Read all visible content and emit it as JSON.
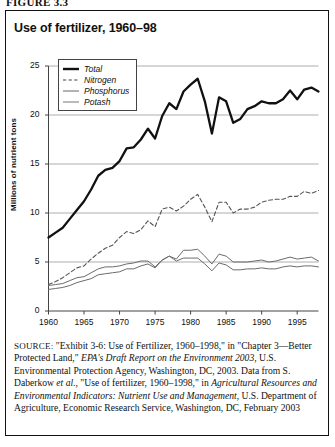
{
  "figure": {
    "label": "FIGURE 3.3",
    "title": "Use of fertilizer, 1960–98"
  },
  "legend": {
    "position": "top-left-inside",
    "items": [
      {
        "label": "Total",
        "style": "thick-solid",
        "color": "#111111"
      },
      {
        "label": "Nitrogen",
        "style": "dashed",
        "color": "#444444"
      },
      {
        "label": "Phosphorus",
        "style": "thin-solid",
        "color": "#666666"
      },
      {
        "label": "Potash",
        "style": "thin-solid",
        "color": "#777777"
      }
    ]
  },
  "axes": {
    "y_title": "Millions of nutrient tons",
    "y_ticks": [
      "0",
      "5",
      "10",
      "15",
      "20",
      "25"
    ],
    "x_ticks": [
      "1960",
      "1965",
      "1970",
      "1975",
      "1980",
      "1985",
      "1990",
      "1995"
    ]
  },
  "source": {
    "label": "SOURCE:",
    "text_1": " \"Exhibit 3-6: Use of Fertilizer, 1960–1998,\" in \"Chapter 3—Better Protected Land,\" ",
    "italic_1": "EPA's Draft Report on the Environment 2003",
    "text_2": ", U.S. Environmental Protection Agency, Washington, DC, 2003. Data from S. Daberkow ",
    "italic_2": "et al.",
    "text_3": ", \"Use of fertilizer, 1960–1998,\" in ",
    "italic_3": "Agricultural Resources and Environmental Indicators: Nutrient Use and Management",
    "text_4": ", U.S. Department of Agriculture, Economic Research Service, Washington, DC, February 2003"
  },
  "chart_data": {
    "type": "line",
    "title": "Use of fertilizer, 1960–98",
    "xlabel": "",
    "ylabel": "Millions of nutrient tons",
    "xlim": [
      1960,
      1998
    ],
    "ylim": [
      0,
      25
    ],
    "grid": "horizontal",
    "legend_position": "upper left",
    "x": [
      1960,
      1961,
      1962,
      1963,
      1964,
      1965,
      1966,
      1967,
      1968,
      1969,
      1970,
      1971,
      1972,
      1973,
      1974,
      1975,
      1976,
      1977,
      1978,
      1979,
      1980,
      1981,
      1982,
      1983,
      1984,
      1985,
      1986,
      1987,
      1988,
      1989,
      1990,
      1991,
      1992,
      1993,
      1994,
      1995,
      1996,
      1997,
      1998
    ],
    "series": [
      {
        "name": "Total",
        "style": "thick-solid",
        "values": [
          7.5,
          8.0,
          8.5,
          9.4,
          10.3,
          11.2,
          12.4,
          13.8,
          14.4,
          14.6,
          15.3,
          16.6,
          16.7,
          17.5,
          18.6,
          17.6,
          19.9,
          21.2,
          20.6,
          22.4,
          23.1,
          23.7,
          21.4,
          18.1,
          21.8,
          21.4,
          19.2,
          19.6,
          20.6,
          20.9,
          21.4,
          21.2,
          21.2,
          21.6,
          22.5,
          21.6,
          22.6,
          22.8,
          22.4
        ]
      },
      {
        "name": "Nitrogen",
        "style": "dashed",
        "values": [
          2.7,
          3.0,
          3.4,
          3.9,
          4.4,
          4.6,
          5.3,
          5.9,
          6.4,
          6.7,
          7.5,
          8.1,
          7.9,
          8.3,
          9.2,
          8.6,
          10.4,
          10.6,
          10.2,
          10.7,
          11.4,
          11.9,
          10.6,
          9.1,
          11.1,
          11.1,
          10.0,
          10.4,
          10.4,
          10.6,
          11.1,
          11.3,
          11.4,
          11.4,
          11.7,
          11.7,
          12.2,
          12.0,
          12.3
        ]
      },
      {
        "name": "Phosphorus",
        "style": "thin-solid",
        "values": [
          2.6,
          2.7,
          2.8,
          3.1,
          3.4,
          3.5,
          3.9,
          4.3,
          4.5,
          4.5,
          4.6,
          4.8,
          4.9,
          5.1,
          5.1,
          4.5,
          5.2,
          5.6,
          5.1,
          5.4,
          5.4,
          5.4,
          4.8,
          4.1,
          4.9,
          4.7,
          4.2,
          4.2,
          4.3,
          4.3,
          4.4,
          4.3,
          4.3,
          4.5,
          4.6,
          4.5,
          4.6,
          4.6,
          4.5
        ]
      },
      {
        "name": "Potash",
        "style": "thin-solid",
        "values": [
          2.2,
          2.3,
          2.4,
          2.6,
          2.9,
          3.1,
          3.3,
          3.7,
          3.8,
          3.9,
          4.0,
          4.3,
          4.3,
          4.6,
          4.8,
          4.4,
          5.2,
          5.6,
          5.3,
          6.2,
          6.2,
          6.3,
          5.6,
          4.8,
          5.8,
          5.6,
          5.0,
          5.0,
          5.0,
          5.1,
          5.2,
          5.0,
          5.1,
          5.3,
          5.5,
          5.3,
          5.4,
          5.5,
          5.1
        ]
      }
    ]
  }
}
